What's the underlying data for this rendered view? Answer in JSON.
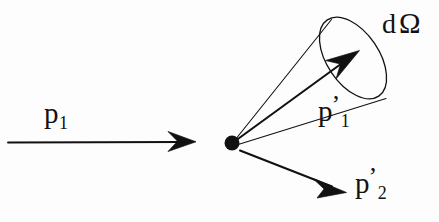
{
  "figure": {
    "kind": "scattering-diagram",
    "width": 439,
    "height": 222,
    "background_color": "#fdfdfd",
    "ink_color": "#111111"
  },
  "labels": {
    "incoming_momentum": {
      "base": "p",
      "subscript": "1",
      "prime": "",
      "full": "p1"
    },
    "scattered_momentum": {
      "base": "p",
      "subscript": "1",
      "prime": "’",
      "full": "p1’"
    },
    "recoil_momentum": {
      "base": "p",
      "subscript": "2",
      "prime": "’",
      "full": "p2’"
    },
    "solid_angle": {
      "differential": "d",
      "symbol": "Ω",
      "full": "dΩ"
    }
  },
  "geometry": {
    "vertex": {
      "x": 232,
      "y": 143,
      "radius": 7.5
    },
    "incoming_arrow": {
      "x1": 8,
      "y1": 142,
      "x2": 193,
      "y2": 142,
      "head_tip_x": 196,
      "head_tip_y": 142
    },
    "scattered_arrow": {
      "x1": 236,
      "y1": 140,
      "x2": 356,
      "y2": 53,
      "head_tip_x": 359,
      "head_tip_y": 51
    },
    "recoil_arrow": {
      "x1": 240,
      "y1": 150,
      "x2": 341,
      "y2": 190,
      "head_tip_x": 345,
      "head_tip_y": 192
    },
    "cone_generator_upper": {
      "x1": 235,
      "y1": 140,
      "x2": 331,
      "y2": 19
    },
    "cone_generator_lower": {
      "x1": 235,
      "y1": 145,
      "x2": 385,
      "y2": 98
    },
    "cone_mouth_ellipse": {
      "cx": 353,
      "cy": 58,
      "rx": 46,
      "ry": 26,
      "rotation_deg": 56
    }
  }
}
